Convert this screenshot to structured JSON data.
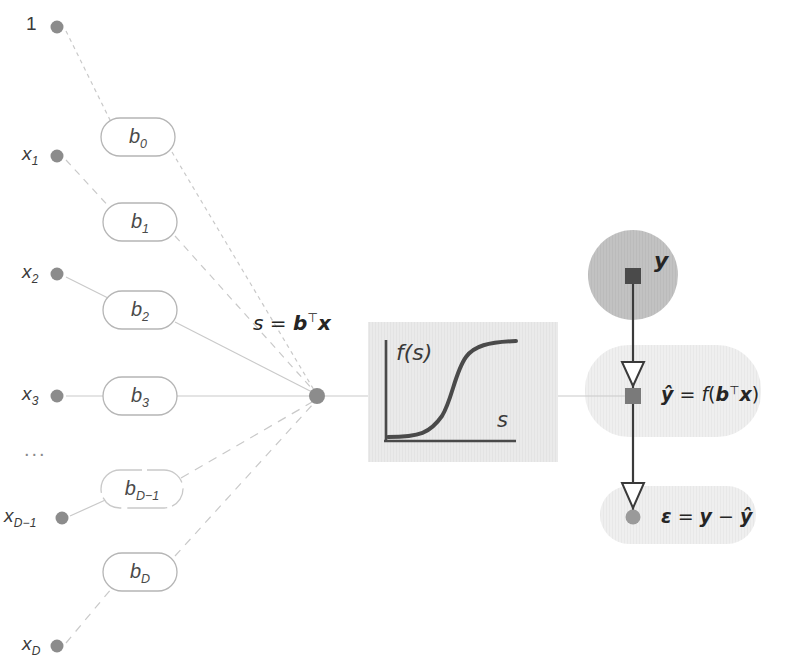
{
  "diagram": {
    "colors": {
      "node_fill": "#8c8c8c",
      "edge_light": "#c9c9c9",
      "edge_dash": "#cccccc",
      "box_stroke": "#b5b5b5",
      "text_dark": "#2b2b2b",
      "label_gray": "#4a4a4a",
      "panel_fill": "#e8e8e8",
      "circle_fill": "#bdbdbd",
      "shade_fill": "#ededed",
      "curve_stroke": "#4a4a4a",
      "marker_dark": "#5a5a5a"
    },
    "inputs": [
      {
        "id": "bias",
        "label": "1",
        "sub": "",
        "cx": 57,
        "cy": 27,
        "style": "plain"
      },
      {
        "id": "x1",
        "label": "x",
        "sub": "1",
        "cx": 57,
        "cy": 156,
        "style": "italic"
      },
      {
        "id": "x2",
        "label": "x",
        "sub": "2",
        "cx": 57,
        "cy": 274,
        "style": "italic"
      },
      {
        "id": "x3",
        "label": "x",
        "sub": "3",
        "cx": 57,
        "cy": 396,
        "style": "italic"
      },
      {
        "id": "xDm1",
        "label": "x",
        "sub": "D−1",
        "cx": 60,
        "cy": 518,
        "style": "italic"
      },
      {
        "id": "xD",
        "label": "x",
        "sub": "D",
        "cx": 57,
        "cy": 646,
        "style": "italic"
      }
    ],
    "ellipsis": "...",
    "weights": [
      {
        "id": "b0",
        "label": "b",
        "sub": "0",
        "cx": 138,
        "cy": 137,
        "w": 74,
        "h": 38,
        "faded": false
      },
      {
        "id": "b1",
        "label": "b",
        "sub": "1",
        "cx": 140,
        "cy": 222,
        "w": 74,
        "h": 38,
        "faded": false
      },
      {
        "id": "b2",
        "label": "b",
        "sub": "2",
        "cx": 140,
        "cy": 310,
        "w": 74,
        "h": 38,
        "faded": false
      },
      {
        "id": "b3",
        "label": "b",
        "sub": "3",
        "cx": 140,
        "cy": 396,
        "w": 74,
        "h": 38,
        "faded": false
      },
      {
        "id": "bDm1",
        "label": "b",
        "sub": "D−1",
        "cx": 142,
        "cy": 489,
        "w": 82,
        "h": 38,
        "faded": true
      },
      {
        "id": "bD",
        "label": "b",
        "sub": "D",
        "cx": 140,
        "cy": 572,
        "w": 74,
        "h": 38,
        "faded": false
      }
    ],
    "sum_node": {
      "cx": 317,
      "cy": 396,
      "r": 8
    },
    "sum_label": {
      "text": "s = b⊤x",
      "s": "s",
      "eq": "=",
      "b": "b",
      "t": "⊤",
      "x": "x",
      "x_pos": 253,
      "y_pos": 310
    },
    "activation_panel": {
      "x": 368,
      "y": 322,
      "w": 190,
      "h": 140,
      "ylabel": "f(s)",
      "xlabel": "s"
    },
    "target": {
      "circle": {
        "cx": 633,
        "cy": 275,
        "r": 45
      },
      "label": "y",
      "label_x": 655,
      "label_y": 250
    },
    "prediction": {
      "shade": {
        "x": 585,
        "y": 345,
        "w": 176,
        "h": 92,
        "r": 44
      },
      "label": "ŷ = f(b⊤x)",
      "parts": {
        "yhat": "ŷ",
        "eq": "=",
        "f": "f",
        "lp": "(",
        "b": "b",
        "t": "⊤",
        "x": "x",
        "rp": ")"
      },
      "label_x": 661,
      "label_y": 383,
      "marker_cx": 633,
      "marker_cy": 396
    },
    "residual": {
      "shade": {
        "x": 600,
        "y": 486,
        "w": 156,
        "h": 58,
        "r": 29
      },
      "label": "ε = y − ŷ",
      "parts": {
        "eps": "ε",
        "eq": "=",
        "y": "y",
        "minus": "−",
        "yhat": "ŷ"
      },
      "label_x": 661,
      "label_y": 506,
      "node_cx": 633,
      "node_cy": 517
    },
    "connectors": {
      "sum_to_panel": {
        "x1": 325,
        "y1": 396,
        "x2": 368,
        "y2": 396
      },
      "panel_to_pred": {
        "x1": 558,
        "y1": 396,
        "x2": 628,
        "y2": 396
      }
    }
  }
}
